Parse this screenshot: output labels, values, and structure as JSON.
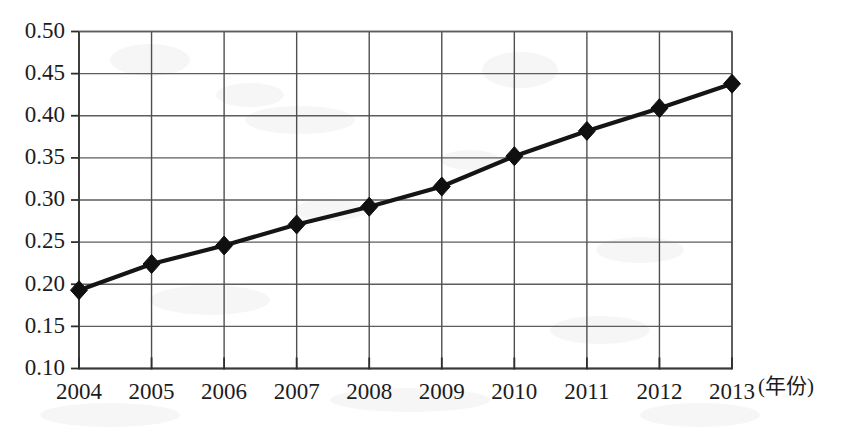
{
  "chart_data": {
    "type": "line",
    "title": "",
    "subtitle": "",
    "xlabel": "(年份)",
    "ylabel": "",
    "categories": [
      "2004",
      "2005",
      "2006",
      "2007",
      "2008",
      "2009",
      "2010",
      "2011",
      "2012",
      "2013"
    ],
    "x": [
      2004,
      2005,
      2006,
      2007,
      2008,
      2009,
      2010,
      2011,
      2012,
      2013
    ],
    "values": [
      0.193,
      0.224,
      0.246,
      0.271,
      0.292,
      0.316,
      0.352,
      0.382,
      0.409,
      0.438
    ],
    "series": [
      {
        "name": "",
        "values": [
          0.193,
          0.224,
          0.246,
          0.271,
          0.292,
          0.316,
          0.352,
          0.382,
          0.409,
          0.438
        ],
        "color": "#101010",
        "marker": "diamond"
      }
    ],
    "ylim": [
      0.1,
      0.5
    ],
    "ytick_values": [
      0.5,
      0.45,
      0.4,
      0.35,
      0.3,
      0.25,
      0.2,
      0.15,
      0.1
    ],
    "ytick_labels": [
      "0.50",
      "0.45",
      "0.40",
      "0.35",
      "0.30",
      "0.25",
      "0.20",
      "0.15",
      "0.10"
    ],
    "xtick_labels": [
      "2004",
      "2005",
      "2006",
      "2007",
      "2008",
      "2009",
      "2010",
      "2011",
      "2012",
      "2013"
    ],
    "grid": {
      "horizontal": true,
      "vertical": true
    },
    "legend": {
      "visible": false,
      "position": "none",
      "entries": []
    },
    "annotations": [],
    "axis_unit_note": "(年份)"
  },
  "axes": {
    "y": {
      "tick_labels": [
        "0.50",
        "0.45",
        "0.40",
        "0.35",
        "0.30",
        "0.25",
        "0.20",
        "0.15",
        "0.10"
      ],
      "min": 0.1,
      "max": 0.5,
      "step": 0.05
    },
    "x": {
      "tick_labels": [
        "2004",
        "2005",
        "2006",
        "2007",
        "2008",
        "2009",
        "2010",
        "2011",
        "2012",
        "2013"
      ],
      "unit_label": "(年份)"
    }
  },
  "colors": {
    "series": "#101010",
    "grid": "#5d5d5d",
    "axis": "#3a3a3a",
    "text": "#1c1c1c",
    "background": "#ffffff"
  }
}
